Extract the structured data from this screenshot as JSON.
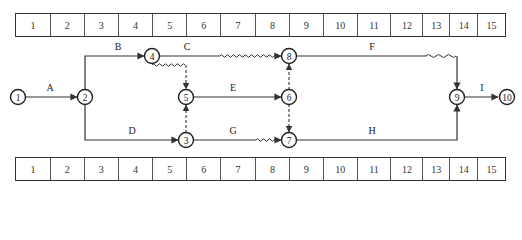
{
  "time_scale": {
    "units": [
      "1",
      "2",
      "3",
      "4",
      "5",
      "6",
      "7",
      "8",
      "9",
      "10",
      "11",
      "12",
      "13",
      "14",
      "15"
    ],
    "column_widths": [
      35,
      34,
      34,
      35,
      34,
      34,
      35,
      34,
      34,
      34,
      34,
      32,
      27,
      28,
      27
    ]
  },
  "nodes": [
    {
      "id": "1",
      "label": "1",
      "x": 18,
      "y": 97
    },
    {
      "id": "2",
      "label": "2",
      "x": 85,
      "y": 97
    },
    {
      "id": "3",
      "label": "3",
      "x": 186,
      "y": 140
    },
    {
      "id": "4",
      "label": "4",
      "x": 152,
      "y": 56
    },
    {
      "id": "5",
      "label": "5",
      "x": 186,
      "y": 97
    },
    {
      "id": "6",
      "label": "6",
      "x": 289,
      "y": 97
    },
    {
      "id": "7",
      "label": "7",
      "x": 289,
      "y": 140
    },
    {
      "id": "8",
      "label": "8",
      "x": 289,
      "y": 56
    },
    {
      "id": "9",
      "label": "9",
      "x": 457,
      "y": 97
    },
    {
      "id": "10",
      "label": "10",
      "x": 507,
      "y": 97
    }
  ],
  "activities": [
    {
      "name": "A",
      "from": "1",
      "to": "2",
      "label_x": 50,
      "label_y": 91
    },
    {
      "name": "B",
      "from": "2",
      "to": "4",
      "label_x": 118,
      "label_y": 50
    },
    {
      "name": "C",
      "from": "4",
      "to": "8",
      "label_x": 187,
      "label_y": 50
    },
    {
      "name": "D",
      "from": "2",
      "to": "3",
      "label_x": 132,
      "label_y": 134
    },
    {
      "name": "E",
      "from": "5",
      "to": "6",
      "label_x": 233,
      "label_y": 91
    },
    {
      "name": "F",
      "from": "8",
      "to": "9",
      "label_x": 372,
      "label_y": 50
    },
    {
      "name": "G",
      "from": "3",
      "to": "7",
      "label_x": 233,
      "label_y": 134
    },
    {
      "name": "H",
      "from": "7",
      "to": "9",
      "label_x": 372,
      "label_y": 134
    },
    {
      "name": "I",
      "from": "9",
      "to": "10",
      "label_x": 482,
      "label_y": 91
    }
  ],
  "dummies": [
    {
      "from": "4",
      "to": "5"
    },
    {
      "from": "3",
      "to": "5"
    },
    {
      "from": "6",
      "to": "8"
    },
    {
      "from": "6",
      "to": "7"
    }
  ],
  "free_float_waves": [
    {
      "on": "4-5",
      "x1": 152,
      "x2": 186,
      "y": 65
    },
    {
      "on": "C",
      "x1": 220,
      "x2": 281,
      "y": 56
    },
    {
      "on": "F",
      "x1": 426,
      "x2": 457,
      "y": 56
    },
    {
      "on": "G",
      "x1": 256,
      "x2": 281,
      "y": 140
    }
  ],
  "colors": {
    "line": "#333333",
    "text": "#222222",
    "background": "#ffffff"
  }
}
